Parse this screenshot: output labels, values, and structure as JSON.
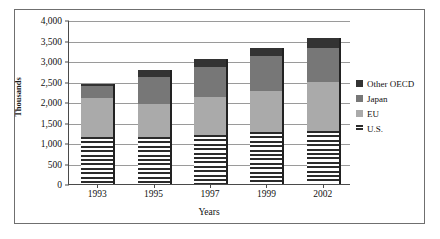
{
  "chart_data": {
    "type": "bar",
    "stacked": true,
    "title": "",
    "xlabel": "Years",
    "ylabel": "Thousands",
    "categories": [
      "1993",
      "1995",
      "1997",
      "1999",
      "2002"
    ],
    "ylim": [
      0,
      4000
    ],
    "ytick_labels": [
      "0",
      "500",
      "1,000",
      "1,500",
      "2,000",
      "2,500",
      "3,000",
      "3,500",
      "4,000"
    ],
    "ytick_values": [
      0,
      500,
      1000,
      1500,
      2000,
      2500,
      3000,
      3500,
      4000
    ],
    "grid": true,
    "legend_position": "right",
    "series": [
      {
        "name": "U.S.",
        "color": "#ffffff",
        "pattern": "horizontal-lines",
        "swatch": "us",
        "values": [
          1150,
          1150,
          1200,
          1270,
          1300
        ]
      },
      {
        "name": "EU",
        "color": "#aaaaaa",
        "pattern": "solid",
        "swatch": "eu",
        "values": [
          950,
          800,
          920,
          1010,
          1200
        ]
      },
      {
        "name": "Japan",
        "color": "#777777",
        "pattern": "solid",
        "swatch": "japan",
        "values": [
          280,
          670,
          740,
          850,
          820
        ]
      },
      {
        "name": "Other OECD",
        "color": "#333333",
        "pattern": "solid",
        "swatch": "other-oecd",
        "values": [
          70,
          160,
          200,
          190,
          250
        ]
      }
    ],
    "totals": [
      2450,
      2780,
      3060,
      3320,
      3570
    ]
  },
  "legend": {
    "items": [
      {
        "label": "Other OECD",
        "swatch": "other-oecd"
      },
      {
        "label": "Japan",
        "swatch": "japan"
      },
      {
        "label": "EU",
        "swatch": "eu"
      },
      {
        "label": "U.S.",
        "swatch": "us"
      }
    ]
  }
}
